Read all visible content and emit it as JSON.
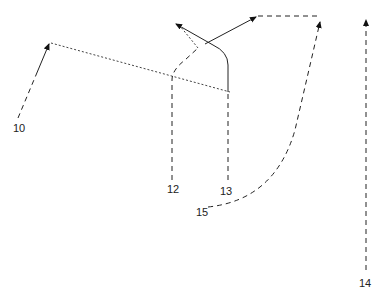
{
  "diagram": {
    "type": "play-diagram",
    "labels": [
      {
        "id": "10",
        "text": "10",
        "x": 13,
        "y": 123
      },
      {
        "id": "12",
        "text": "12",
        "x": 167,
        "y": 184
      },
      {
        "id": "13",
        "text": "13",
        "x": 220,
        "y": 186
      },
      {
        "id": "15",
        "text": "15",
        "x": 196,
        "y": 207
      },
      {
        "id": "14",
        "text": "14",
        "x": 359,
        "y": 278
      }
    ],
    "paths": [
      {
        "id": "route-10",
        "style": "dash-then-solid",
        "desc": "10 up-right to arrow at (50,42)"
      },
      {
        "id": "route-10-ext",
        "style": "dotted",
        "desc": "from (50,42) to (230,92)"
      },
      {
        "id": "route-12",
        "style": "dashed",
        "desc": "12 up to (173,78) then curve to dotted return arrow at (175,22)"
      },
      {
        "id": "route-13",
        "style": "dashed-then-solid",
        "desc": "13 up to (230,70) then curve to arrow at (175,22)"
      },
      {
        "id": "route-13b",
        "style": "solid",
        "desc": "arrow from (205,45) to (258,16)"
      },
      {
        "id": "route-top",
        "style": "dashed",
        "desc": "(258,16) to (322,16)"
      },
      {
        "id": "route-15",
        "style": "dashed",
        "desc": "15 curve up to arrow at (322,18)"
      },
      {
        "id": "route-14",
        "style": "dashed",
        "desc": "14 straight up to arrow at (366,17)"
      }
    ]
  }
}
